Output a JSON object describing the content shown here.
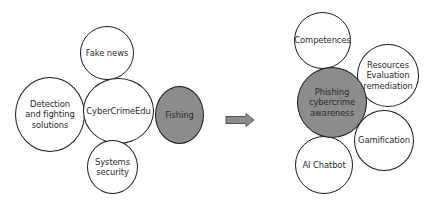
{
  "left_diagram": {
    "center": {
      "label": "CyberCrimeEdu"
    },
    "nodes": [
      {
        "id": "fake-news",
        "label": "Fake news"
      },
      {
        "id": "detection",
        "label": "Detection\nand fighting\nsolutions"
      },
      {
        "id": "fishing",
        "label": "Fishing",
        "highlighted": true
      },
      {
        "id": "systems-security",
        "label": "Systems\nsecurity"
      }
    ]
  },
  "arrow": {
    "direction": "right",
    "color": "#8c8c8c"
  },
  "right_diagram": {
    "center": {
      "label": "Phishing\ncybercrime\nawareness",
      "highlighted": true
    },
    "nodes": [
      {
        "id": "competences",
        "label": "Competences"
      },
      {
        "id": "resources",
        "label": "Resources\nEvaluation\nremediation"
      },
      {
        "id": "gamification",
        "label": "Gamification"
      },
      {
        "id": "ai-chatbot",
        "label": "AI Chatbot"
      }
    ]
  },
  "colors": {
    "highlight_fill": "#8c8c8c",
    "outline": "#1a1a1a",
    "background": "#ffffff"
  }
}
